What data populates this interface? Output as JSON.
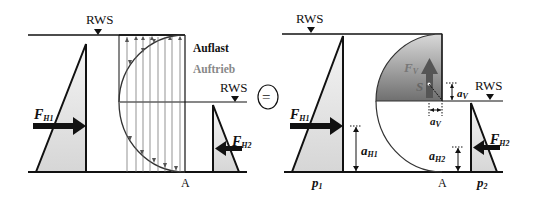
{
  "left_panel": {
    "rws_top": "RWS",
    "rws_right": "RWS",
    "legend_load": "Auflast",
    "legend_buoyancy": "Auftrieb",
    "force_h1": {
      "main": "F",
      "sub": "H1"
    },
    "force_h2": {
      "main": "F",
      "sub": "H2"
    },
    "point": "A"
  },
  "equals_symbol": "=",
  "right_panel": {
    "rws_top": "RWS",
    "rws_right": "RWS",
    "force_h1": {
      "main": "F",
      "sub": "H1"
    },
    "force_h2": {
      "main": "F",
      "sub": "H2"
    },
    "force_v": {
      "main": "F",
      "sub": "V"
    },
    "centroid": "S",
    "a_v_vertical": {
      "main": "a",
      "sub": "V"
    },
    "a_v_horizontal": {
      "main": "a",
      "sub": "V"
    },
    "a_h1": {
      "main": "a",
      "sub": "H1"
    },
    "a_h2": {
      "main": "a",
      "sub": "H2"
    },
    "p1": {
      "main": "p",
      "sub": "1"
    },
    "p2": {
      "main": "p",
      "sub": "2"
    },
    "point": "A"
  },
  "colors": {
    "line": "#111111",
    "pressure_fill": "#e2e2e2",
    "water_body": "#8a8a8a",
    "buoyancy_text": "#888888"
  }
}
